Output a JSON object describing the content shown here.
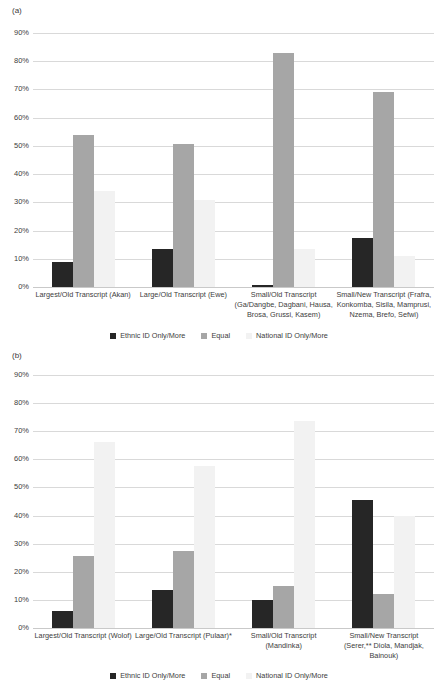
{
  "colors": {
    "ethnic": "#262626",
    "equal": "#a6a6a6",
    "national": "#f2f2f2",
    "gridline": "#d9d9d9"
  },
  "panels": [
    {
      "tag": "(a)",
      "yticks": [
        "90%",
        "80%",
        "70%",
        "60%",
        "50%",
        "40%",
        "30%",
        "20%",
        "10%",
        "0%"
      ],
      "legend": [
        "Ethnic ID Only/More",
        "Equal",
        "National ID Only/More"
      ],
      "categories": [
        "Largest/Old Transcript (Akan)",
        "Large/Old Transcript (Ewe)",
        "Small/Old Transcript (Ga/Dangbe, Dagbani, Hausa, Brosa, Grussi, Kasem)",
        "Small/New Transcript (Frafra, Konkomba, Sisila, Mamprusi, Nzema, Brefo, Sefwi)"
      ]
    },
    {
      "tag": "(b)",
      "yticks": [
        "90%",
        "80%",
        "70%",
        "60%",
        "50%",
        "40%",
        "30%",
        "20%",
        "10%",
        "0%"
      ],
      "legend": [
        "Ethnic ID Only/More",
        "Equal",
        "National ID Only/More"
      ],
      "categories": [
        "Largest/Old Transcript (Wolof)",
        "Large/Old Transcript (Pulaar)*",
        "Small/Old Transcript (Mandinka)",
        "Small/New Transcript (Serer,** Diola, Mandjak, Bainouk)"
      ]
    }
  ],
  "chart_data": [
    {
      "type": "bar",
      "title": "(a)",
      "xlabel": "",
      "ylabel": "",
      "ylim": [
        0,
        90
      ],
      "ytick_labels": [
        "0%",
        "10%",
        "20%",
        "30%",
        "40%",
        "50%",
        "60%",
        "70%",
        "80%",
        "90%"
      ],
      "grid": true,
      "legend_position": "bottom",
      "categories": [
        "Largest/Old Transcript (Akan)",
        "Large/Old Transcript (Ewe)",
        "Small/Old Transcript (Ga/Dangbe, Dagbani, Hausa, Brosa, Grussi, Kasem)",
        "Small/New Transcript (Frafra, Konkomba, Sisila, Mamprusi, Nzema, Brefo, Sefwi)"
      ],
      "series": [
        {
          "name": "Ethnic ID Only/More",
          "color": "#262626",
          "values": [
            9,
            13.5,
            0.7,
            17.5
          ]
        },
        {
          "name": "Equal",
          "color": "#a6a6a6",
          "values": [
            54,
            50.5,
            83,
            69
          ]
        },
        {
          "name": "National ID Only/More",
          "color": "#f2f2f2",
          "values": [
            34,
            31,
            13.5,
            11
          ]
        }
      ]
    },
    {
      "type": "bar",
      "title": "(b)",
      "xlabel": "",
      "ylabel": "",
      "ylim": [
        0,
        90
      ],
      "ytick_labels": [
        "0%",
        "10%",
        "20%",
        "30%",
        "40%",
        "50%",
        "60%",
        "70%",
        "80%",
        "90%"
      ],
      "grid": true,
      "legend_position": "bottom",
      "categories": [
        "Largest/Old Transcript (Wolof)",
        "Large/Old Transcript (Pulaar)*",
        "Small/Old Transcript (Mandinka)",
        "Small/New Transcript (Serer,** Diola, Mandjak, Bainouk)"
      ],
      "series": [
        {
          "name": "Ethnic ID Only/More",
          "color": "#262626",
          "values": [
            6,
            13.5,
            10,
            45.5
          ]
        },
        {
          "name": "Equal",
          "color": "#a6a6a6",
          "values": [
            25.5,
            27.5,
            15,
            12
          ]
        },
        {
          "name": "National ID Only/More",
          "color": "#f2f2f2",
          "values": [
            66,
            57.5,
            73.5,
            40
          ]
        }
      ]
    }
  ]
}
